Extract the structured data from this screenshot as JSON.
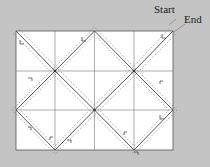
{
  "diagram": {
    "labels": {
      "start": "Start",
      "end": "End"
    },
    "grid": {
      "columns": 4,
      "rows": 3
    },
    "colors": {
      "background": "#c4c4c4",
      "panel": "#ffffff",
      "line": "#555555",
      "dash": "#6a6a6a"
    }
  }
}
